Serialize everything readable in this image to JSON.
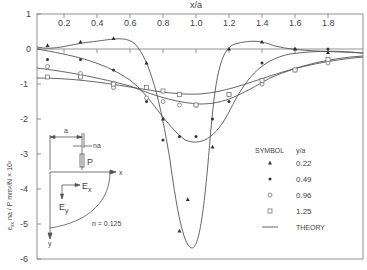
{
  "chart_data": {
    "type": "line",
    "title": "",
    "xlabel": "x/a",
    "ylabel": "ε_xx na / P   mm²/N × 10²",
    "xlim": [
      0.04,
      2.0
    ],
    "ylim": [
      -6,
      1
    ],
    "x_ticks": [
      "0.2",
      "0.4",
      "0.6",
      "0.8",
      "1.0",
      "1.2",
      "1.4",
      "1.6",
      "1.8"
    ],
    "y_ticks": [
      "1",
      "0",
      "-1",
      "-2",
      "-3",
      "-4",
      "-5",
      "-6"
    ],
    "grid": false,
    "legend": {
      "header_symbol": "SYMBOL",
      "header_param": "y/a",
      "position": "right-middle",
      "entries": [
        {
          "symbol": "filled-triangle",
          "label": "0.22"
        },
        {
          "symbol": "filled-circle",
          "label": "0.49"
        },
        {
          "symbol": "open-circle",
          "label": "0.96"
        },
        {
          "symbol": "open-square",
          "label": "1.25"
        },
        {
          "symbol": "line",
          "label": "THEORY"
        }
      ]
    },
    "series": [
      {
        "name": "y/a = 0.22",
        "marker": "filled-triangle",
        "x": [
          0.1,
          0.3,
          0.5,
          0.7,
          0.8,
          0.9,
          0.95,
          1.1,
          1.2,
          1.4,
          1.6,
          1.8
        ],
        "y": [
          0.1,
          0.2,
          0.3,
          -0.4,
          -2.0,
          -5.2,
          -4.3,
          -2.8,
          0.0,
          0.2,
          0.0,
          -0.1
        ]
      },
      {
        "name": "y/a = 0.49",
        "marker": "filled-circle",
        "x": [
          0.1,
          0.3,
          0.5,
          0.7,
          0.8,
          0.9,
          1.0,
          1.1,
          1.2,
          1.4,
          1.6,
          1.8
        ],
        "y": [
          -0.3,
          -0.3,
          -0.6,
          -1.5,
          -2.6,
          -2.5,
          -2.5,
          -2.0,
          -1.5,
          -0.4,
          0.0,
          0.0
        ]
      },
      {
        "name": "y/a = 0.96",
        "marker": "open-circle",
        "x": [
          0.1,
          0.3,
          0.5,
          0.7,
          0.8,
          0.9,
          1.0,
          1.2,
          1.4,
          1.6,
          1.8
        ],
        "y": [
          -0.5,
          -0.7,
          -1.1,
          -1.4,
          -1.5,
          -1.6,
          -1.6,
          -1.3,
          -1.0,
          -0.6,
          -0.4
        ]
      },
      {
        "name": "y/a = 1.25",
        "marker": "open-square",
        "x": [
          0.1,
          0.3,
          0.5,
          0.7,
          0.8,
          0.9,
          1.0,
          1.2,
          1.4,
          1.6,
          1.8
        ],
        "y": [
          -0.8,
          -0.8,
          -1.0,
          -1.1,
          -1.2,
          -1.3,
          -1.6,
          -1.3,
          -0.9,
          -0.6,
          -0.3
        ]
      }
    ],
    "annotations": [
      "n = 0.125",
      "P",
      "a",
      "na",
      "E_x",
      "E_y",
      "x",
      "y"
    ]
  },
  "figure": {
    "x_axis_title": "x/a",
    "y_axis_title_main": "ε",
    "y_axis_title_sub": "xx",
    "y_axis_title_rest": " na / P   mm²/N × 10²",
    "inset_labels": {
      "a": "a",
      "na": "na",
      "load": "P",
      "x_axis": "x",
      "y_axis": "y",
      "ex": "E",
      "ex_sub": "x",
      "ey": "E",
      "ey_sub": "y",
      "n_value": "n = 0.125"
    }
  }
}
